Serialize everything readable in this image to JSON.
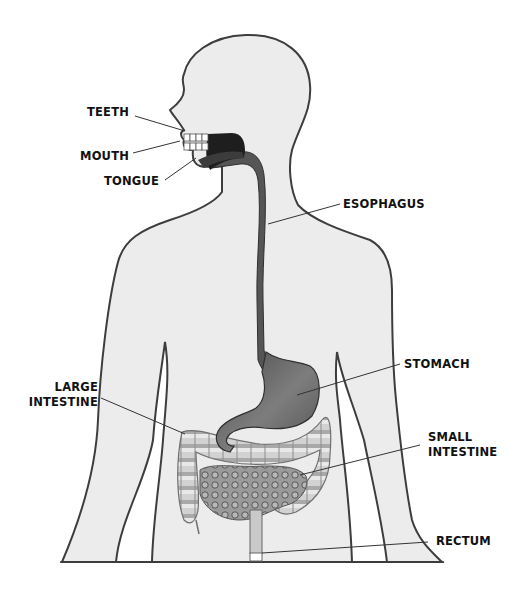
{
  "diagram": {
    "colors": {
      "body_fill": "#ececec",
      "outline": "#3d3d3d",
      "esophagus": "#5a5a5a",
      "mouth_cavity": "#1e1e1e",
      "stomach": "#6b6b6b",
      "large_intestine": "#c8c8c8",
      "small_intestine": "#8a8a8a",
      "leader_line": "#333333"
    },
    "labels": {
      "teeth": "TEETH",
      "mouth": "MOUTH",
      "tongue": "TONGUE",
      "esophagus": "ESOPHAGUS",
      "stomach": "STOMACH",
      "large_intestine_line1": "LARGE",
      "large_intestine_line2": "INTESTINE",
      "small_intestine_line1": "SMALL",
      "small_intestine_line2": "INTESTINE",
      "rectum": "RECTUM"
    }
  }
}
